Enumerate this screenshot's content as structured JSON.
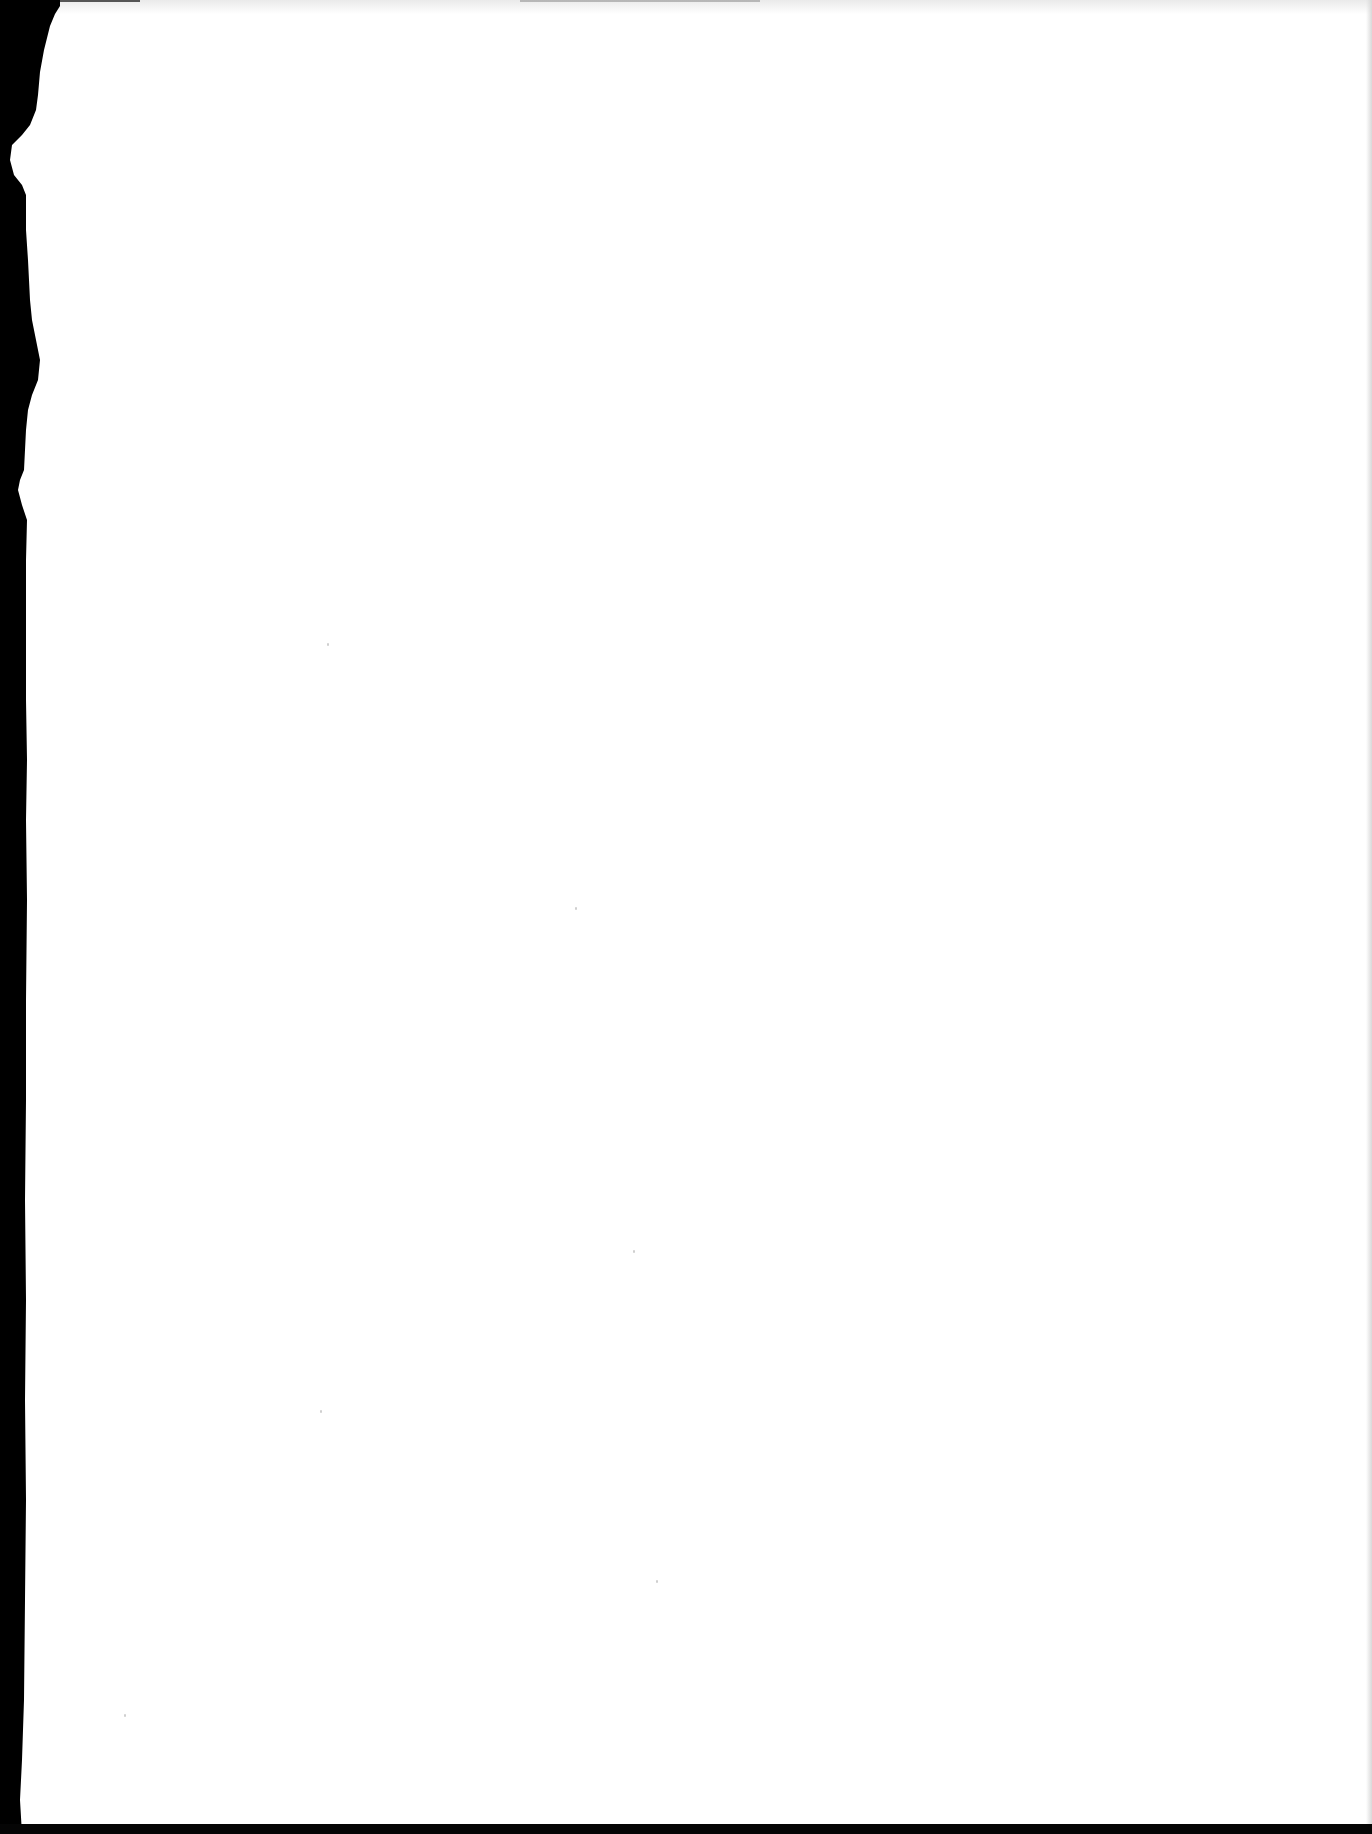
{
  "document": {
    "type": "scanned-page",
    "text": "",
    "paper_color": "#ffffff",
    "edge_color": "#000000",
    "content_present": false
  }
}
